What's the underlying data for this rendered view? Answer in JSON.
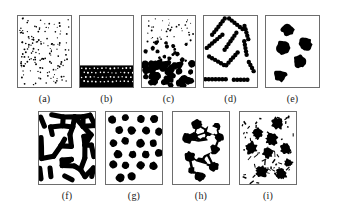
{
  "figure": {
    "title": "",
    "background_color": "#ffffff",
    "ink_color": "#000000",
    "frame_color": "#6d6d6d",
    "rows": 2,
    "panel_count": 9
  },
  "panels": [
    {
      "id": "a",
      "label": "(a)",
      "row": "top",
      "description": "dispersed gas-like phase of many tiny isolated particles uniformly filling the box",
      "particle_count": 150,
      "particle_radius": 0.7,
      "fill_fraction": 0.05,
      "morphology": "dilute-dispersion"
    },
    {
      "id": "b",
      "label": "(b)",
      "row": "top",
      "description": "complete sedimentation: dense close-packed layer of particles resting at the bottom, clear region above",
      "particle_count": 120,
      "particle_radius": 2.6,
      "sediment_top_fraction": 0.6,
      "morphology": "sedimented-bed"
    },
    {
      "id": "c",
      "label": "(c)",
      "row": "top",
      "description": "gradient state: small particles suspended at top grading into larger aggregated clusters settled at the bottom",
      "particle_count": 110,
      "morphology": "settling-gradient"
    },
    {
      "id": "d",
      "label": "(d)",
      "row": "top",
      "description": "anisotropic linear chains and rods of beads oriented at random angles",
      "chain_count": 11,
      "beads_per_chain": 7,
      "bead_radius": 2.4,
      "morphology": "linear-chains"
    },
    {
      "id": "e",
      "label": "(e)",
      "row": "top",
      "description": "five separated compact irregular clusters dispersed in the box",
      "cluster_count": 5,
      "morphology": "compact-clusters"
    },
    {
      "id": "f",
      "label": "(f)",
      "row": "bottom",
      "description": "bicontinuous interconnected network of thick strands, spinodal-like texture",
      "strand_width": 5,
      "fill_fraction": 0.45,
      "morphology": "bicontinuous-network"
    },
    {
      "id": "g",
      "label": "(g)",
      "row": "bottom",
      "description": "regular array of about twenty equally sized round droplets",
      "droplet_count": 22,
      "droplet_radius": 4.2,
      "morphology": "monodisperse-droplets"
    },
    {
      "id": "h",
      "label": "(h)",
      "row": "bottom",
      "description": "single percolating aggregate of large blobs linked by necks, enclosing white polygonal voids",
      "blob_count": 12,
      "morphology": "percolating-aggregate"
    },
    {
      "id": "i",
      "label": "(i)",
      "row": "bottom",
      "description": "large ragged star-like aggregates surrounded by many small elongated fragments",
      "aggregate_count": 9,
      "fragment_count": 60,
      "morphology": "ragged-aggregates-with-debris"
    }
  ],
  "chart_data": {
    "type": "scatter",
    "title": "",
    "subtitle": "",
    "xlabel": "",
    "ylabel": "",
    "grid": false,
    "legend": "none",
    "panel_labels": [
      "(a)",
      "(b)",
      "(c)",
      "(d)",
      "(e)",
      "(f)",
      "(g)",
      "(h)",
      "(i)"
    ],
    "rows": [
      [
        "(a)",
        "(b)",
        "(c)",
        "(d)",
        "(e)"
      ],
      [
        "(f)",
        "(g)",
        "(h)",
        "(i)"
      ]
    ],
    "series": [
      {
        "name": "(a)",
        "morphology": "dilute-dispersion",
        "values": [
          150,
          0.7
        ]
      },
      {
        "name": "(b)",
        "morphology": "sedimented-bed",
        "values": [
          120,
          2.6
        ]
      },
      {
        "name": "(c)",
        "morphology": "settling-gradient",
        "values": [
          110,
          2.0
        ]
      },
      {
        "name": "(d)",
        "morphology": "linear-chains",
        "values": [
          11,
          2.4
        ]
      },
      {
        "name": "(e)",
        "morphology": "compact-clusters",
        "values": [
          5,
          8.0
        ]
      },
      {
        "name": "(f)",
        "morphology": "bicontinuous-network",
        "values": [
          1,
          5.0
        ]
      },
      {
        "name": "(g)",
        "morphology": "monodisperse-droplets",
        "values": [
          22,
          4.2
        ]
      },
      {
        "name": "(h)",
        "morphology": "percolating-aggregate",
        "values": [
          12,
          6.0
        ]
      },
      {
        "name": "(i)",
        "morphology": "ragged-aggregates-with-debris",
        "values": [
          9,
          7.0
        ]
      }
    ]
  }
}
